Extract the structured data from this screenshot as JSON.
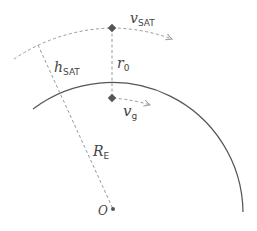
{
  "diagram": {
    "labels": {
      "v_sat": {
        "main": "v",
        "sub": "SAT"
      },
      "h_sat": {
        "main": "h",
        "sub": "SAT"
      },
      "r0": {
        "main": "r",
        "sub": "0"
      },
      "v_g": {
        "main": "v",
        "sub": "g"
      },
      "r_e": {
        "main": "R",
        "sub": "E"
      },
      "origin": {
        "main": "O"
      }
    },
    "colors": {
      "earth_arc": "#555555",
      "dashed": "#999999",
      "points": "#555555"
    }
  }
}
